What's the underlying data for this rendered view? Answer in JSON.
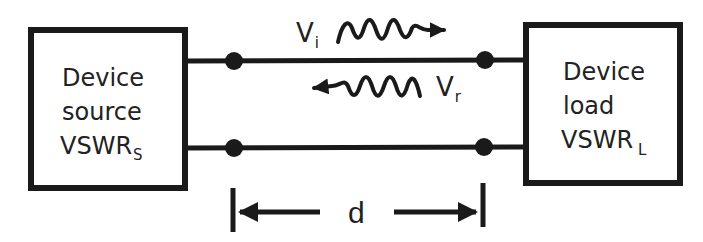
{
  "diagram": {
    "colors": {
      "stroke": "#1a1a1a",
      "background": "#ffffff",
      "text": "#222222"
    },
    "source_box": {
      "lines": [
        "Device",
        "source"
      ],
      "vswr_main": "VSWR",
      "vswr_sub": "S"
    },
    "load_box": {
      "lines": [
        "Device",
        "load"
      ],
      "vswr_main": "VSWR",
      "vswr_sub": "L"
    },
    "incident_wave": {
      "main": "V",
      "sub": "i",
      "direction": "right"
    },
    "reflected_wave": {
      "main": "V",
      "sub": "r",
      "direction": "left"
    },
    "distance": {
      "label": "d"
    }
  }
}
